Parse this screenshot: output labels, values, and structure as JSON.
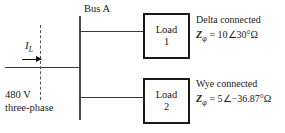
{
  "diagram": {
    "bus": {
      "label": "Bus A"
    },
    "source": {
      "current_symbol": "I",
      "current_subscript": "L",
      "voltage": "480 V",
      "phase": "three-phase"
    },
    "loads": [
      {
        "box_title": "Load",
        "box_number": "1",
        "connection": "Delta connected",
        "impedance_symbol": "Z",
        "impedance_subscript": "φ",
        "impedance_value": "= 10∠30°Ω"
      },
      {
        "box_title": "Load",
        "box_number": "2",
        "connection": "Wye connected",
        "impedance_symbol": "Z",
        "impedance_subscript": "φ",
        "impedance_value": "= 5∠−36.87°Ω"
      }
    ],
    "colors": {
      "wire": "#3a3a3a",
      "box_border": "#1a1a1a",
      "text": "#1a1a1a",
      "background": "#ffffff"
    }
  }
}
